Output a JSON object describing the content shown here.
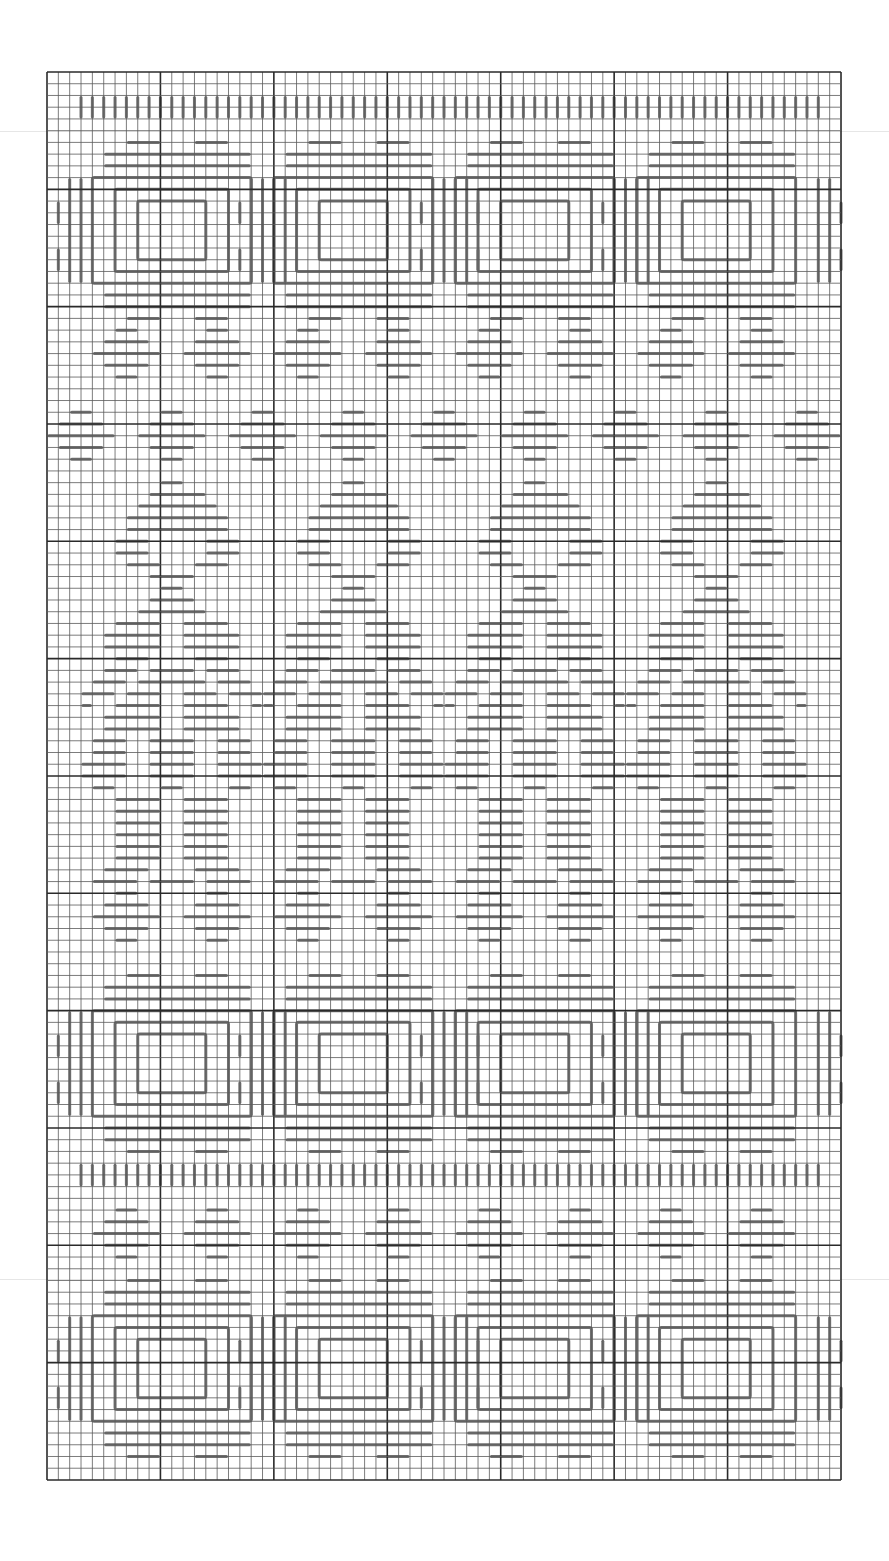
{
  "chart_data": {
    "type": "needlework-chart",
    "title": "",
    "grid": {
      "columns": 70,
      "rows": 120,
      "left": 47,
      "top": 72,
      "cell_w": 11.343,
      "cell_h": 11.733,
      "major_every": 10,
      "minor_color": "#5a5a5a",
      "major_color": "#2a2a2a",
      "border_color": "#2a2a2a"
    },
    "stitch_color": "#707070",
    "scan_lines": [
      131,
      1279
    ],
    "bands": [
      {
        "name": "top-border",
        "type": "vdash_row",
        "row_start": 2,
        "row_end": 4,
        "col_start": 3,
        "col_end": 68
      },
      {
        "name": "square-motifs-top",
        "type": "square",
        "center_row": 13,
        "centers_col": [
          11,
          27,
          43,
          59
        ]
      },
      {
        "name": "diamond-row-1",
        "type": "diamond",
        "center_row": 24,
        "centers_col": [
          7,
          15,
          23,
          31,
          39,
          47,
          55,
          63
        ]
      },
      {
        "name": "diamond-row-2",
        "type": "diamond",
        "center_row": 31,
        "centers_col": [
          3,
          11,
          19,
          27,
          35,
          43,
          51,
          59,
          67
        ]
      },
      {
        "name": "tree-motifs",
        "type": "tree",
        "top_row": 35,
        "centers_col": [
          11,
          27,
          43,
          59
        ]
      },
      {
        "name": "diamond-row-3",
        "type": "diamond",
        "center_row": 72,
        "centers_col": [
          7,
          15,
          23,
          31,
          39,
          47,
          55,
          63
        ]
      },
      {
        "name": "square-motifs-mid",
        "type": "square",
        "center_row": 84,
        "centers_col": [
          11,
          27,
          43,
          59
        ]
      },
      {
        "name": "middle-border",
        "type": "vdash_row",
        "row_start": 93,
        "row_end": 95,
        "col_start": 3,
        "col_end": 68
      },
      {
        "name": "diamond-row-4",
        "type": "diamond",
        "center_row": 99,
        "centers_col": [
          7,
          15,
          23,
          31,
          39,
          47,
          55,
          63
        ]
      },
      {
        "name": "square-motifs-bottom",
        "type": "square",
        "center_row": 110,
        "centers_col": [
          11,
          27,
          43,
          59
        ]
      }
    ],
    "legend": [],
    "xlabel": "",
    "ylabel": ""
  },
  "accessibility": {
    "label": "Bargello needlepoint stitch chart"
  }
}
